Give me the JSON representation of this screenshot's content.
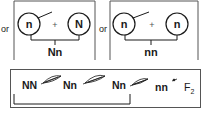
{
  "panels": [
    {
      "prefix": "or",
      "left_allele": "n",
      "plus": "+",
      "right_allele": "N",
      "result": "Nn"
    },
    {
      "prefix": "or",
      "left_allele": "n",
      "plus": "+",
      "right_allele": "n",
      "result": "nn"
    }
  ],
  "generations": {
    "items": [
      "NN",
      "Nn",
      "Nn",
      "nn"
    ],
    "final_label": "F",
    "final_subscript": "2"
  },
  "colors": {
    "ink": "#1a1a1a",
    "border": "#555555"
  }
}
